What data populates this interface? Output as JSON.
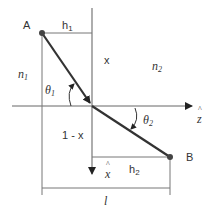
{
  "diagram": {
    "type": "refraction-geometry",
    "points": [
      {
        "id": "A",
        "label": "A",
        "x": 42,
        "y": 33
      },
      {
        "id": "B",
        "label": "B",
        "x": 170,
        "y": 157
      }
    ],
    "labels": {
      "point_a": "A",
      "point_b": "B",
      "h1": "h",
      "h1_sub": "1",
      "h2": "h",
      "h2_sub": "2",
      "x": "x",
      "one_minus_x": "1 - x",
      "n1": "n",
      "n1_sub": "1",
      "n2": "n",
      "n2_sub": "2",
      "theta1": "θ",
      "theta1_sub": "1",
      "theta2": "θ",
      "theta2_sub": "2",
      "z_axis": "z",
      "x_axis": "x",
      "length": "l"
    },
    "colors": {
      "ray": "#333333",
      "lines": "#777777",
      "background": "#ffffff"
    }
  }
}
